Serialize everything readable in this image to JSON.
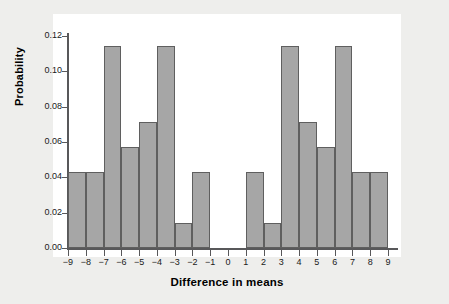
{
  "chart_data": {
    "type": "bar",
    "title": "",
    "subtitle": "",
    "xlabel": "Difference in means",
    "ylabel": "Probability",
    "grid": false,
    "legend": null,
    "xlim": [
      -9,
      9
    ],
    "ylim": [
      0.0,
      0.12
    ],
    "x_tick_labels": [
      "−9",
      "−8",
      "−7",
      "−6",
      "−5",
      "−4",
      "−3",
      "−2",
      "−1",
      "0",
      "1",
      "2",
      "3",
      "4",
      "5",
      "6",
      "7",
      "8",
      "9"
    ],
    "x_tick_values": [
      -9,
      -8,
      -7,
      -6,
      -5,
      -4,
      -3,
      -2,
      -1,
      0,
      1,
      2,
      3,
      4,
      5,
      6,
      7,
      8,
      9
    ],
    "y_tick_labels": [
      "0.00",
      "0.02",
      "0.04",
      "0.06",
      "0.08",
      "0.10",
      "0.12"
    ],
    "y_tick_values": [
      0.0,
      0.02,
      0.04,
      0.06,
      0.08,
      0.1,
      0.12
    ],
    "bin_edges": [
      -9,
      -8,
      -7,
      -6,
      -5,
      -4,
      -3,
      -2,
      -1,
      0,
      1,
      2,
      3,
      4,
      5,
      6,
      7,
      8,
      9
    ],
    "bins": [
      {
        "label": "−9 to −8",
        "x0": -9,
        "x1": -8,
        "value": 0.0429
      },
      {
        "label": "−8 to −7",
        "x0": -8,
        "x1": -7,
        "value": 0.0429
      },
      {
        "label": "−7 to −6",
        "x0": -7,
        "x1": -6,
        "value": 0.1143
      },
      {
        "label": "−6 to −5",
        "x0": -6,
        "x1": -5,
        "value": 0.0571
      },
      {
        "label": "−5 to −4",
        "x0": -5,
        "x1": -4,
        "value": 0.0714
      },
      {
        "label": "−4 to −3",
        "x0": -4,
        "x1": -3,
        "value": 0.1143
      },
      {
        "label": "−3 to −2",
        "x0": -3,
        "x1": -2,
        "value": 0.0143
      },
      {
        "label": "−2 to −1",
        "x0": -2,
        "x1": -1,
        "value": 0.0429
      },
      {
        "label": "−1 to 0",
        "x0": -1,
        "x1": 0,
        "value": 0.0
      },
      {
        "label": "0 to 1",
        "x0": 0,
        "x1": 1,
        "value": 0.0
      },
      {
        "label": "1 to 2",
        "x0": 1,
        "x1": 2,
        "value": 0.0429
      },
      {
        "label": "2 to 3",
        "x0": 2,
        "x1": 3,
        "value": 0.0143
      },
      {
        "label": "3 to 4",
        "x0": 3,
        "x1": 4,
        "value": 0.1143
      },
      {
        "label": "4 to 5",
        "x0": 4,
        "x1": 5,
        "value": 0.0714
      },
      {
        "label": "5 to 6",
        "x0": 5,
        "x1": 6,
        "value": 0.0571
      },
      {
        "label": "6 to 7",
        "x0": 6,
        "x1": 7,
        "value": 0.1143
      },
      {
        "label": "7 to 8",
        "x0": 7,
        "x1": 8,
        "value": 0.0429
      },
      {
        "label": "8 to 9",
        "x0": 8,
        "x1": 9,
        "value": 0.0429
      }
    ],
    "colors": {
      "bar_fill": "#a6a6a6",
      "bar_edge": "#5f5f5f",
      "axis": "#58585a",
      "panel_background": "#ffffff",
      "page_background": "#eeeeec",
      "text": "#1a1a1a"
    }
  }
}
